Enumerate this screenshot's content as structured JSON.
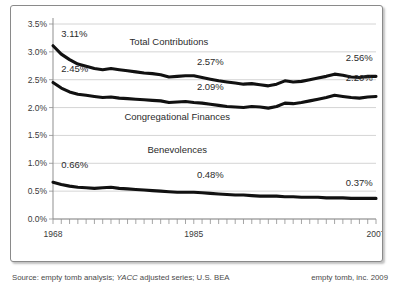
{
  "chart_data": {
    "type": "line",
    "title": "",
    "xlabel": "",
    "ylabel": "",
    "xlim": [
      1968,
      2007
    ],
    "ylim": [
      0.0,
      3.5
    ],
    "grid": true,
    "legend_position": "inline-annotations",
    "y_ticks": [
      "0.0%",
      "0.5%",
      "1.0%",
      "1.5%",
      "2.0%",
      "2.5%",
      "3.0%",
      "3.5%"
    ],
    "y_tick_values": [
      0.0,
      0.5,
      1.0,
      1.5,
      2.0,
      2.5,
      3.0,
      3.5
    ],
    "x_ticks": [
      "1968",
      "1985",
      "2007"
    ],
    "x_tick_values": [
      1968,
      1985,
      2007
    ],
    "x": [
      1968,
      1969,
      1970,
      1971,
      1972,
      1973,
      1974,
      1975,
      1976,
      1977,
      1978,
      1979,
      1980,
      1981,
      1982,
      1983,
      1984,
      1985,
      1986,
      1987,
      1988,
      1989,
      1990,
      1991,
      1992,
      1993,
      1994,
      1995,
      1996,
      1997,
      1998,
      1999,
      2000,
      2001,
      2002,
      2003,
      2004,
      2005,
      2006,
      2007
    ],
    "series": [
      {
        "name": "Total Contributions",
        "color": "#111111",
        "values": [
          3.11,
          2.96,
          2.86,
          2.78,
          2.74,
          2.7,
          2.68,
          2.7,
          2.68,
          2.66,
          2.64,
          2.62,
          2.61,
          2.59,
          2.55,
          2.56,
          2.57,
          2.57,
          2.54,
          2.51,
          2.48,
          2.46,
          2.44,
          2.42,
          2.43,
          2.41,
          2.39,
          2.42,
          2.48,
          2.46,
          2.47,
          2.5,
          2.53,
          2.56,
          2.6,
          2.58,
          2.55,
          2.54,
          2.56,
          2.56
        ],
        "start_label": "3.11%",
        "mid_label": "2.57%",
        "end_label": "2.56%"
      },
      {
        "name": "Congregational Finances",
        "color": "#111111",
        "values": [
          2.45,
          2.35,
          2.28,
          2.24,
          2.22,
          2.2,
          2.18,
          2.19,
          2.17,
          2.16,
          2.15,
          2.14,
          2.13,
          2.12,
          2.09,
          2.1,
          2.11,
          2.09,
          2.08,
          2.06,
          2.04,
          2.02,
          2.01,
          2.0,
          2.02,
          2.01,
          1.99,
          2.02,
          2.08,
          2.07,
          2.09,
          2.12,
          2.15,
          2.18,
          2.22,
          2.2,
          2.18,
          2.17,
          2.19,
          2.2
        ],
        "start_label": "2.45%",
        "mid_label": "2.09%",
        "end_label": "2.20%"
      },
      {
        "name": "Benevolences",
        "color": "#111111",
        "values": [
          0.66,
          0.62,
          0.59,
          0.57,
          0.56,
          0.55,
          0.56,
          0.57,
          0.55,
          0.54,
          0.53,
          0.52,
          0.51,
          0.5,
          0.49,
          0.48,
          0.48,
          0.48,
          0.47,
          0.46,
          0.45,
          0.44,
          0.43,
          0.43,
          0.42,
          0.41,
          0.41,
          0.41,
          0.4,
          0.4,
          0.39,
          0.39,
          0.39,
          0.38,
          0.38,
          0.38,
          0.37,
          0.37,
          0.37,
          0.37
        ],
        "start_label": "0.66%",
        "mid_label": "0.48%",
        "end_label": "0.37%"
      }
    ],
    "annotations": [
      {
        "text": "Total Contributions",
        "x": 1982,
        "y": 3.12
      },
      {
        "text": "Congregational Finances",
        "x": 1983,
        "y": 1.78
      },
      {
        "text": "Benevolences",
        "x": 1983,
        "y": 1.18
      }
    ]
  },
  "footer": {
    "source_prefix": "Source: empty tomb analysis; ",
    "source_italic": "YACC",
    "source_suffix": " adjusted series; U.S. BEA",
    "credit": "empty tomb, inc. 2009"
  }
}
